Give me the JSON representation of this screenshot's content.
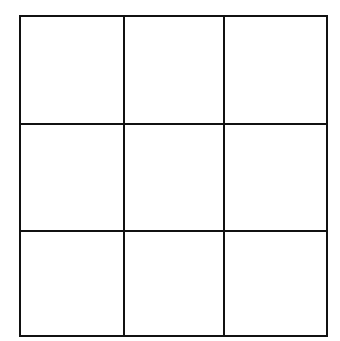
{
  "diagram": {
    "type": "grid",
    "rows": 3,
    "columns": 3,
    "line_color": "#111111",
    "background_color": "#ffffff",
    "line_width": 2,
    "x_lines": [
      20,
      124,
      224,
      327
    ],
    "y_lines": [
      16,
      124,
      231,
      336
    ],
    "cells": [
      {
        "row": 0,
        "col": 0,
        "label": ""
      },
      {
        "row": 0,
        "col": 1,
        "label": ""
      },
      {
        "row": 0,
        "col": 2,
        "label": ""
      },
      {
        "row": 1,
        "col": 0,
        "label": ""
      },
      {
        "row": 1,
        "col": 1,
        "label": ""
      },
      {
        "row": 1,
        "col": 2,
        "label": ""
      },
      {
        "row": 2,
        "col": 0,
        "label": ""
      },
      {
        "row": 2,
        "col": 1,
        "label": ""
      },
      {
        "row": 2,
        "col": 2,
        "label": ""
      }
    ]
  }
}
